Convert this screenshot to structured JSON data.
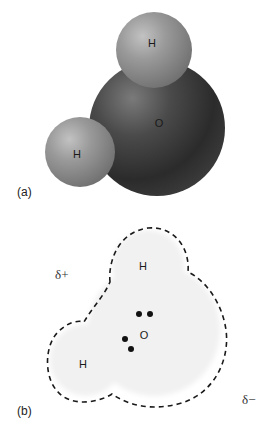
{
  "figure": {
    "panel_a": {
      "label": "(a)",
      "caption_kind": "space-filling model",
      "atoms": [
        {
          "symbol": "H",
          "position": "top"
        },
        {
          "symbol": "O",
          "position": "center"
        },
        {
          "symbol": "H",
          "position": "left"
        }
      ]
    },
    "panel_b": {
      "label": "(b)",
      "caption_kind": "electron cloud outline with lone pairs",
      "atoms": [
        {
          "symbol": "H",
          "position": "top"
        },
        {
          "symbol": "O",
          "position": "center"
        },
        {
          "symbol": "H",
          "position": "left"
        }
      ],
      "charges": {
        "positive": "δ+",
        "negative": "δ−"
      },
      "lone_pair_count": 2
    }
  },
  "colors": {
    "hydrogen": "#8a8a8a",
    "oxygen": "#3a3a3a",
    "cloud_fill": "#f1f1f1",
    "outline": "#1a1a1a"
  }
}
